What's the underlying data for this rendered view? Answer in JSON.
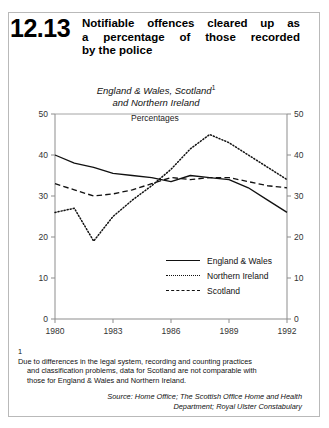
{
  "header": {
    "number": "12.13",
    "title_line1": "Notifiable offences cleared up as",
    "title_line2": "a percentage of those recorded",
    "title_line3": "by the police"
  },
  "subtitle": {
    "line1": "England & Wales, Scotland",
    "footnote_marker": "1",
    "line2": "and Northern Ireland"
  },
  "percentages_label": "Percentages",
  "legend": {
    "items": [
      {
        "label": "England & Wales",
        "style": "solid"
      },
      {
        "label": "Northern Ireland",
        "style": "dotted"
      },
      {
        "label": "Scotland",
        "style": "dashed"
      }
    ]
  },
  "footnote": {
    "number": "1",
    "line1": "Due to differences in the legal system, recording and counting practices",
    "line2": "and classification problems, data for Scotland are not comparable with",
    "line3": "those for England & Wales and Northern Ireland."
  },
  "source": {
    "line1": "Source: Home Office; The Scottish Office Home and Health",
    "line2": "Department; Royal Ulster Constabulary"
  },
  "axis": {
    "y_left_ticks": [
      "50",
      "40",
      "30",
      "20",
      "10",
      "0"
    ],
    "y_right_ticks": [
      "50",
      "40",
      "30",
      "20",
      "10",
      "0"
    ],
    "x_ticks": [
      "1980",
      "1983",
      "1986",
      "1989",
      "1992"
    ]
  },
  "chart_data": {
    "type": "line",
    "title": "Notifiable offences cleared up as a percentage of those recorded by the police",
    "subtitle": "England & Wales, Scotland and Northern Ireland",
    "xlabel": "",
    "ylabel": "Percentages",
    "xlim": [
      1980,
      1992
    ],
    "ylim": [
      0,
      50
    ],
    "ytick_values": [
      0,
      10,
      20,
      30,
      40,
      50
    ],
    "xtick_values": [
      1980,
      1983,
      1986,
      1989,
      1992
    ],
    "grid": false,
    "legend_position": "inside-lower-right",
    "x": [
      1980,
      1981,
      1982,
      1983,
      1984,
      1985,
      1986,
      1987,
      1988,
      1989,
      1990,
      1991,
      1992
    ],
    "series": [
      {
        "name": "England & Wales",
        "style": "solid",
        "color": "#111111",
        "values": [
          40.0,
          38.0,
          37.0,
          35.5,
          35.0,
          34.5,
          33.5,
          35.0,
          34.5,
          34.0,
          32.0,
          29.0,
          26.0
        ]
      },
      {
        "name": "Northern Ireland",
        "style": "dotted",
        "color": "#111111",
        "values": [
          26.0,
          27.0,
          19.0,
          25.0,
          29.0,
          32.5,
          36.5,
          41.5,
          45.0,
          43.0,
          40.0,
          37.0,
          34.0
        ]
      },
      {
        "name": "Scotland",
        "style": "dashed",
        "color": "#111111",
        "values": [
          33.0,
          31.5,
          30.0,
          30.5,
          31.5,
          33.0,
          34.5,
          34.0,
          34.5,
          34.5,
          33.5,
          32.5,
          32.0
        ]
      }
    ]
  }
}
